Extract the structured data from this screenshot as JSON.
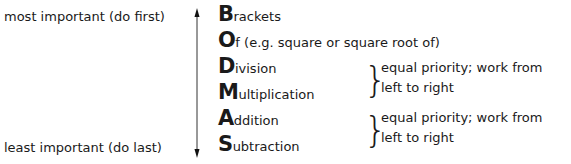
{
  "labels": {
    "top": "most important (do first)",
    "bottom": "least important (do last)"
  },
  "rows": [
    {
      "letter": "B",
      "rest": "rackets"
    },
    {
      "letter": "O",
      "rest": "f (e.g. square or square root of)"
    },
    {
      "letter": "D",
      "rest": "ivision"
    },
    {
      "letter": "M",
      "rest": "ultiplication"
    },
    {
      "letter": "A",
      "rest": "ddition"
    },
    {
      "letter": "S",
      "rest": "ubtraction"
    }
  ],
  "notes": [
    {
      "line1": "equal priority; work from",
      "line2": "left to right"
    },
    {
      "line1": "equal priority; work from",
      "line2": "left to right"
    }
  ]
}
